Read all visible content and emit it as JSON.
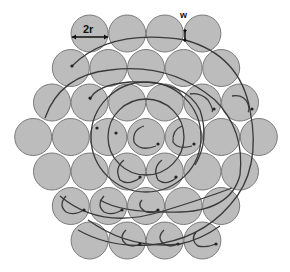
{
  "figure": {
    "type": "hexagonal-circle-packing",
    "rows": [
      4,
      5,
      6,
      7,
      6,
      5,
      4
    ],
    "circle_count": 37,
    "colors": {
      "fill": "#bcbcbc",
      "stroke": "#7a7a7a",
      "curves": "#3a3a3a",
      "background": "#ffffff"
    },
    "geometry": {
      "center_x": 146,
      "center_y": 137,
      "radius": 18.5,
      "pitch_x": 37.6,
      "pitch_y": 34.5
    }
  },
  "labels": {
    "diameter": "2r",
    "gap": "w"
  }
}
